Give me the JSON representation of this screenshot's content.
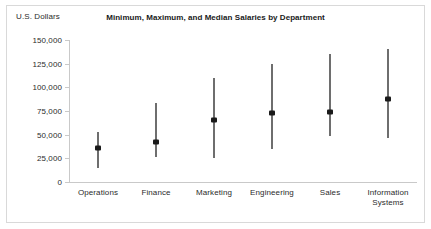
{
  "chart_data": {
    "type": "range",
    "title": "Minimum, Maximum, and Median Salaries by Department",
    "xlabel": "",
    "ylabel": "U.S. Dollars",
    "ylim": [
      0,
      150000
    ],
    "yticks": [
      0,
      25000,
      50000,
      75000,
      100000,
      125000,
      150000
    ],
    "ytick_labels": [
      "0",
      "25,000",
      "50,000",
      "75,000",
      "100,000",
      "125,000",
      "150,000"
    ],
    "grid": false,
    "legend": "none",
    "categories": [
      "Operations",
      "Finance",
      "Marketing",
      "Engineering",
      "Sales",
      "Information\nSystems"
    ],
    "series": [
      {
        "name": "Minimum",
        "values": [
          15000,
          26000,
          25000,
          35000,
          49000,
          46000
        ]
      },
      {
        "name": "Median",
        "values": [
          36000,
          42000,
          65000,
          73000,
          74000,
          88000
        ]
      },
      {
        "name": "Maximum",
        "values": [
          53000,
          83000,
          110000,
          125000,
          135000,
          140000
        ]
      }
    ],
    "colors": {
      "range_line": "#6e6e6e",
      "median_marker": "#1a1a1a",
      "axis": "#c9c9c9",
      "text": "#2b2b2b",
      "border": "#d9d9d9",
      "background": "#ffffff"
    }
  }
}
